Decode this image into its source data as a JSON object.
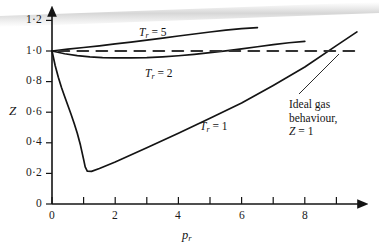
{
  "figure": {
    "background_color": "#ffffff",
    "ink_color": "#141414"
  },
  "axes": {
    "y_title": "Z",
    "x_title_base": "p",
    "x_title_sub": "r",
    "y_tick_labels": [
      "0",
      "0·2",
      "0·4",
      "0·6",
      "0·8",
      "1·0",
      "1·2"
    ],
    "y_tick_values": [
      0,
      0.2,
      0.4,
      0.6,
      0.8,
      1.0,
      1.2
    ],
    "x_tick_labels": [
      "0",
      "2",
      "4",
      "6",
      "8"
    ],
    "x_tick_values": [
      0,
      1,
      2,
      3,
      4,
      5,
      6,
      7,
      8,
      9
    ]
  },
  "labels": {
    "tr5_var": "T",
    "tr5_sub": "r",
    "tr5_value": " = 5",
    "tr2_var": "T",
    "tr2_sub": "r",
    "tr2_value": " = 2",
    "tr1_var": "T",
    "tr1_sub": "r",
    "tr1_value": " = 1"
  },
  "annotation": {
    "line1": "Ideal gas",
    "line2": "behaviour,",
    "line3_var": "Z",
    "line3_rest": " = 1"
  },
  "chart_data": {
    "type": "line",
    "title": "",
    "xlabel": "p_r",
    "ylabel": "Z",
    "xlim": [
      0,
      9.8
    ],
    "ylim": [
      0,
      1.25
    ],
    "grid": false,
    "legend": "inline-labels",
    "series": [
      {
        "name": "T_r = 5",
        "style": "solid",
        "points": [
          [
            0.0,
            1.0
          ],
          [
            0.5,
            1.012
          ],
          [
            1.0,
            1.023
          ],
          [
            1.5,
            1.034
          ],
          [
            2.0,
            1.046
          ],
          [
            2.5,
            1.058
          ],
          [
            3.0,
            1.071
          ],
          [
            3.5,
            1.084
          ],
          [
            4.0,
            1.098
          ],
          [
            4.5,
            1.111
          ],
          [
            5.0,
            1.124
          ],
          [
            5.5,
            1.136
          ],
          [
            6.0,
            1.146
          ],
          [
            6.5,
            1.153
          ]
        ]
      },
      {
        "name": "T_r = 2",
        "style": "solid",
        "points": [
          [
            0.0,
            1.0
          ],
          [
            0.4,
            0.982
          ],
          [
            0.8,
            0.97
          ],
          [
            1.2,
            0.962
          ],
          [
            1.6,
            0.957
          ],
          [
            2.0,
            0.955
          ],
          [
            2.5,
            0.955
          ],
          [
            3.0,
            0.957
          ],
          [
            3.5,
            0.962
          ],
          [
            4.0,
            0.969
          ],
          [
            4.5,
            0.978
          ],
          [
            5.0,
            0.989
          ],
          [
            5.5,
            1.001
          ],
          [
            6.0,
            1.014
          ],
          [
            6.5,
            1.028
          ],
          [
            7.0,
            1.042
          ],
          [
            7.5,
            1.054
          ],
          [
            8.0,
            1.063
          ]
        ]
      },
      {
        "name": "T_r = 1",
        "style": "solid",
        "points": [
          [
            0.0,
            1.0
          ],
          [
            0.1,
            0.905
          ],
          [
            0.2,
            0.828
          ],
          [
            0.3,
            0.762
          ],
          [
            0.4,
            0.702
          ],
          [
            0.5,
            0.645
          ],
          [
            0.6,
            0.588
          ],
          [
            0.7,
            0.528
          ],
          [
            0.8,
            0.462
          ],
          [
            0.9,
            0.385
          ],
          [
            1.0,
            0.292
          ],
          [
            1.05,
            0.243
          ],
          [
            1.12,
            0.214
          ],
          [
            1.25,
            0.213
          ],
          [
            1.5,
            0.232
          ],
          [
            2.0,
            0.275
          ],
          [
            3.0,
            0.368
          ],
          [
            4.0,
            0.463
          ],
          [
            5.0,
            0.56
          ],
          [
            6.0,
            0.66
          ],
          [
            7.0,
            0.775
          ],
          [
            8.0,
            0.895
          ],
          [
            9.0,
            1.035
          ],
          [
            9.65,
            1.125
          ]
        ]
      },
      {
        "name": "Ideal gas behaviour, Z = 1",
        "style": "dashed",
        "points": [
          [
            0.2,
            1.0
          ],
          [
            9.7,
            1.0
          ]
        ]
      }
    ],
    "annotations": [
      {
        "text": "T_r = 5",
        "x": 3.6,
        "y": 1.16
      },
      {
        "text": "T_r = 2",
        "x": 4.0,
        "y": 0.905
      },
      {
        "text": "T_r = 1",
        "x": 5.6,
        "y": 0.565
      },
      {
        "text": "Ideal gas behaviour, Z = 1",
        "x": 8.2,
        "y": 0.62
      }
    ]
  }
}
